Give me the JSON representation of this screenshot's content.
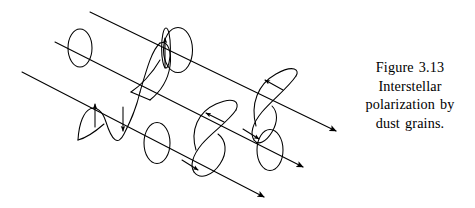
{
  "figure": {
    "id": "interstellar-polarization-diagram",
    "stroke_color": "#000000",
    "background_color": "#ffffff",
    "rays": [
      {
        "name": "upper-ray",
        "start": [
          90,
          12
        ],
        "end": [
          336,
          131
        ],
        "arrowhead": true
      },
      {
        "name": "middle-ray",
        "start": [
          55,
          42
        ],
        "end": [
          303,
          167
        ],
        "arrowhead": true
      },
      {
        "name": "lower-ray",
        "start": [
          22,
          72
        ],
        "end": [
          264,
          197
        ],
        "arrowhead": true
      }
    ],
    "grains": [
      {
        "name": "grain-upper-left",
        "center": [
          80,
          48
        ],
        "rx": 12,
        "ry": 19
      },
      {
        "name": "grain-upper-right",
        "center": [
          178,
          50
        ],
        "rx": 14,
        "ry": 22
      },
      {
        "name": "grain-middle",
        "center": [
          157,
          143
        ],
        "rx": 13,
        "ry": 20
      },
      {
        "name": "grain-lower-right",
        "center": [
          270,
          150
        ],
        "rx": 13,
        "ry": 20
      }
    ],
    "wave_trains": [
      {
        "name": "plane-polarized-wave-left",
        "type": "transverse-sine",
        "polarization": "linear-vertical",
        "arrows": 2
      },
      {
        "name": "helical-wave-upper-right",
        "type": "helix",
        "polarization": "circular",
        "arrows": 2
      },
      {
        "name": "helical-wave-lower",
        "type": "helix",
        "polarization": "circular",
        "arrows": 2
      },
      {
        "name": "vertical-wave-upper-middle",
        "type": "transverse-sine",
        "polarization": "linear-vertical",
        "arrows": 1
      }
    ]
  },
  "caption": {
    "lines": [
      "Figure 3.13",
      "Interstellar",
      "polarization by",
      "dust grains."
    ],
    "line1": "Figure 3.13",
    "line2": "Interstellar",
    "line3": "polarization by",
    "line4": "dust grains."
  }
}
